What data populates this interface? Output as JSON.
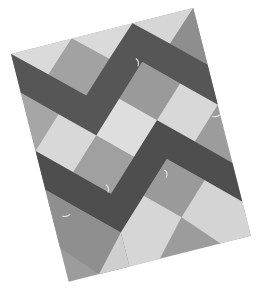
{
  "image": {
    "subject": "zig-zag patchwork quilt photographed at an angle",
    "colors": {
      "background": "#ffffff",
      "light": "#d9d9d9",
      "medium": "#9c9c9c",
      "dark": "#565656",
      "darker": "#4a4a4a"
    },
    "grid": {
      "columns": 3,
      "rows": 4
    }
  }
}
